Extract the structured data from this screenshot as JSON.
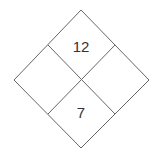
{
  "diagram": {
    "type": "diamond-factor-puzzle",
    "cells": {
      "top": "12",
      "left": "",
      "right": "",
      "bottom": "7"
    },
    "line_color": "#666666"
  }
}
